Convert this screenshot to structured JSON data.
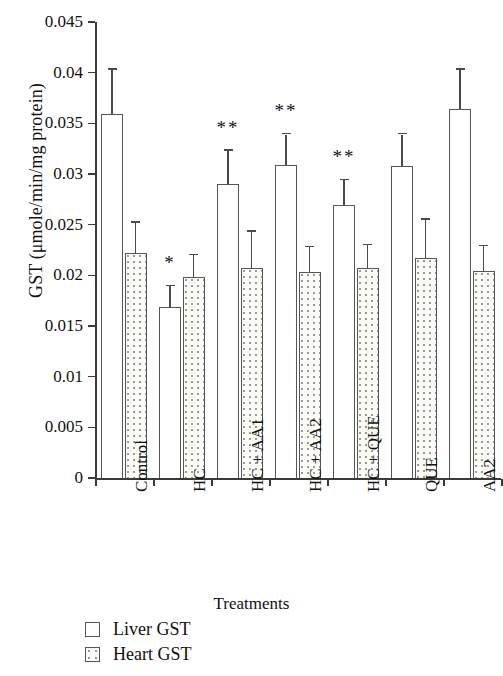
{
  "chart_data": {
    "type": "bar",
    "title": "",
    "xlabel": "Treatments",
    "ylabel": "GST (μmole/min/mg protein)",
    "categories": [
      "Control",
      "HC",
      "HC + AA1",
      "HC + AA2",
      "HC + QUE",
      "QUE",
      "AA2"
    ],
    "ylim": [
      0,
      0.045
    ],
    "ytick_labels": [
      "0",
      "0.005",
      "0.01",
      "0.015",
      "0.02",
      "0.025",
      "0.03",
      "0.035",
      "0.04",
      "0.045"
    ],
    "ytick_values": [
      0,
      0.005,
      0.01,
      0.015,
      0.02,
      0.025,
      0.03,
      0.035,
      0.04,
      0.045
    ],
    "grid": false,
    "legend_position": "bottom-left",
    "series": [
      {
        "name": "Liver GST",
        "fill": "open",
        "values": [
          0.0359,
          0.0169,
          0.029,
          0.0309,
          0.0269,
          0.0308,
          0.0364
        ],
        "errors": [
          0.0044,
          0.002,
          0.0033,
          0.003,
          0.0025,
          0.0031,
          0.0039
        ],
        "significance": [
          "",
          "*",
          "**",
          "**",
          "**",
          "",
          ""
        ]
      },
      {
        "name": "Heart GST",
        "fill": "dotted",
        "values": [
          0.0222,
          0.0198,
          0.0207,
          0.0203,
          0.0207,
          0.0217,
          0.0204
        ],
        "errors": [
          0.003,
          0.0022,
          0.0036,
          0.0025,
          0.0023,
          0.0038,
          0.0025
        ],
        "significance": [
          "",
          "",
          "",
          "",
          "",
          "",
          ""
        ]
      }
    ]
  },
  "legend": {
    "items": [
      {
        "label": "Liver GST",
        "swatch": "open-square"
      },
      {
        "label": "Heart GST",
        "swatch": "dotted-square"
      }
    ]
  }
}
